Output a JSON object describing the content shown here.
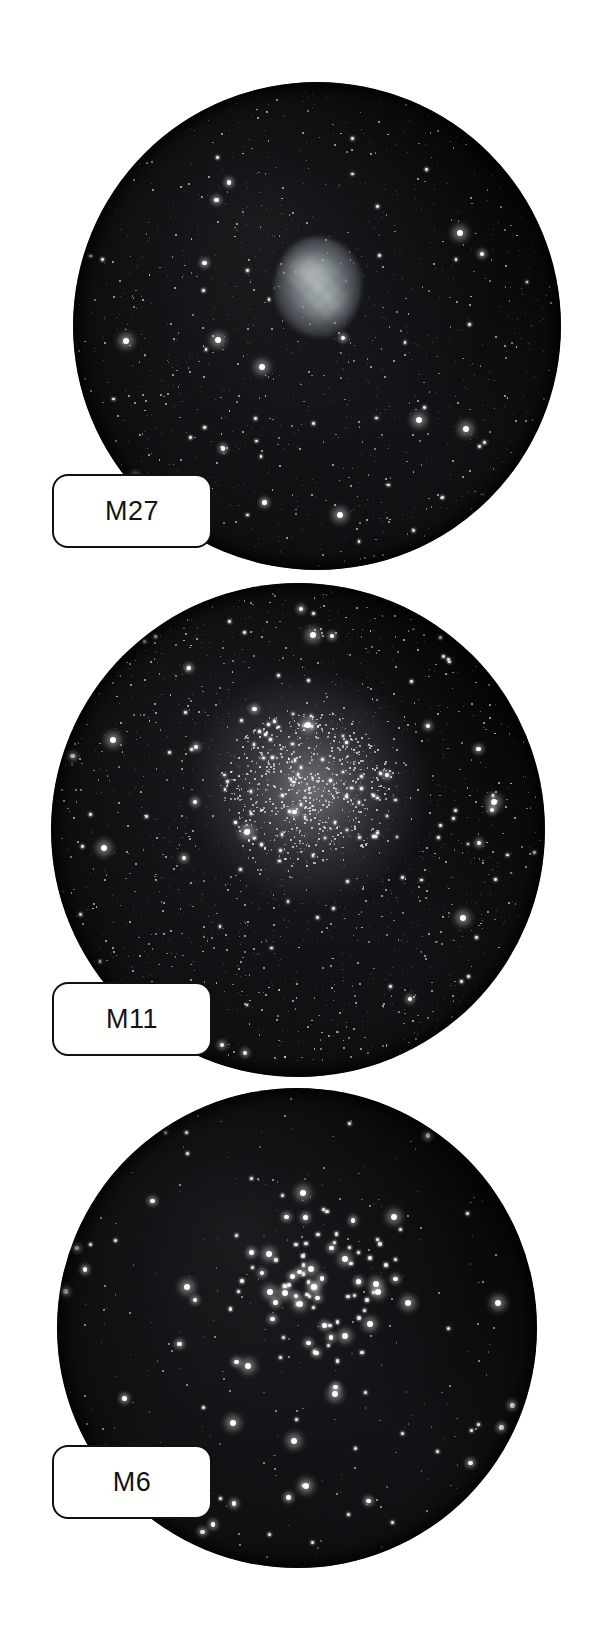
{
  "page": {
    "width": 593,
    "height": 1636,
    "background_color": "#ffffff"
  },
  "style": {
    "sky_color": "#050506",
    "star_color": "#ffffff",
    "label_border_color": "#111111",
    "label_fill_color": "#ffffff",
    "label_text_color": "#141414",
    "nebula_color": "#bcc6c8"
  },
  "panels": [
    {
      "id": "panel-m27",
      "label": "M27",
      "object_type": "planetary-nebula",
      "circle": {
        "cx": 317,
        "cy": 326,
        "r": 244
      },
      "label_box": {
        "x": 52,
        "y": 474,
        "w": 160,
        "h": 74
      },
      "nebula": {
        "cx": 318,
        "cy": 287,
        "rx": 44,
        "ry": 50
      },
      "star_count": 900,
      "star_density": "rich",
      "notes": "Dumbbell Nebula: soft grey apple-core glow left of field centre with dense star field"
    },
    {
      "id": "panel-m11",
      "label": "M11",
      "object_type": "open-cluster-rich",
      "circle": {
        "cx": 298,
        "cy": 830,
        "r": 247
      },
      "label_box": {
        "x": 52,
        "y": 982,
        "w": 160,
        "h": 74
      },
      "cluster": {
        "cx": 310,
        "cy": 788,
        "r": 62
      },
      "star_count": 1400,
      "star_density": "very-rich",
      "notes": "Wild Duck Cluster: dense compact knot of faint stars near field centre"
    },
    {
      "id": "panel-m6",
      "label": "M6",
      "object_type": "open-cluster-sparse",
      "circle": {
        "cx": 297,
        "cy": 1328,
        "r": 240
      },
      "label_box": {
        "x": 52,
        "y": 1445,
        "w": 160,
        "h": 74
      },
      "cluster": {
        "cx": 312,
        "cy": 1285,
        "r": 70
      },
      "star_count": 260,
      "star_density": "sparse",
      "notes": "Butterfly Cluster: few dozen bright scattered stars on a nearly empty black field"
    }
  ]
}
